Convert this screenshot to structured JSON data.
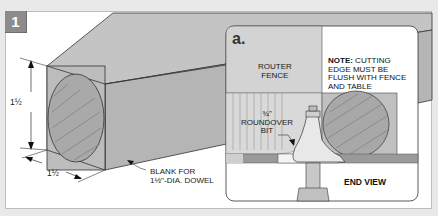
{
  "figure": {
    "step_number": "1",
    "colors": {
      "background": "#e9e9e9",
      "panel": "#ffffff",
      "badge": "#8c8c8c",
      "wood_gray": "#b8b8b8",
      "wood_dark": "#9e9e9e",
      "fence": "#d2d2d2"
    }
  },
  "main_view": {
    "height_dim": "1½",
    "width_dim": "1½",
    "blank_label_line1": "BLANK FOR",
    "blank_label_line2": "1½\"-DIA. DOWEL"
  },
  "inset": {
    "letter": "a.",
    "fence_label_line1": "ROUTER",
    "fence_label_line2": "FENCE",
    "note_bold": "NOTE:",
    "note_line1": " CUTTING",
    "note_line2": "EDGE MUST BE",
    "note_line3": "FLUSH WITH FENCE",
    "note_line4": "AND TABLE",
    "bit_label_line1": "¾\"",
    "bit_label_line2": "ROUNDOVER",
    "bit_label_line3": "BIT",
    "view_label": "END VIEW"
  }
}
